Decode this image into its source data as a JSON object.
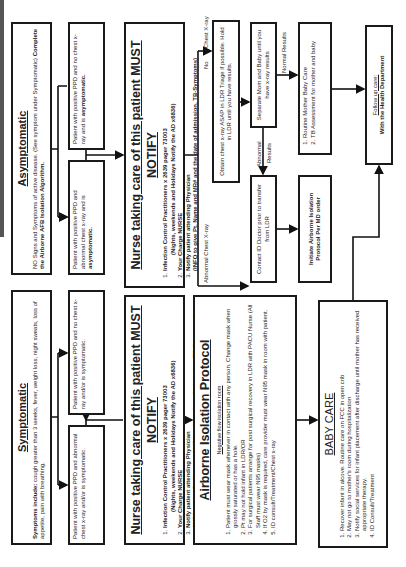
{
  "asymptomatic": {
    "title": "Asymptomatic",
    "body_plain": "NO Signs and Symptoms of active disease. (See symptom under Symptomatic)   ",
    "body_bold": "Complete the Airborne AFB Isolation Algorithm."
  },
  "symptomatic": {
    "title": "Symptomatic",
    "body_bold": "Symptoms include:",
    "body_plain": " cough greater than 3 weeks, fever, weight loss, night sweats, loss of appetite, pain with breathing."
  },
  "asym_no_cxr": {
    "text": "Patient with positive PPD and no chest x-ray and is ",
    "bold": "asymptomatic."
  },
  "asym_abnormal": {
    "text": "Patient with positive PPD and abnormal chest x-ray and is ",
    "bold": "asymptomatic."
  },
  "sym_no_cxr": {
    "text": "Patient with positive PPD and no chest x-ray and/or is ",
    "bold": "symptomatic."
  },
  "sym_abnormal": {
    "text": "Patient with positive PPD and abnormal chest x-ray and/or is ",
    "bold": "symptomatic."
  },
  "nurse": {
    "title": "Nurse taking care of this patient MUST NOTIFY",
    "items": [
      "Infection Control Practitioners x 2639 pager 73003",
      "Your Charge NURSE",
      "Notify patient attending Physician"
    ],
    "item1_note": "(Nights, weekends and Holidays Notify the AD x6836)",
    "item3_note": "(INFO to give Pt. Name and MR# and the date of admission, TB-Symptoms)"
  },
  "obtain_cxr": {
    "text": "Obtain chest x-ray ASAP in LDR Triage if possible.  Hold in LDR until you have results."
  },
  "separate": {
    "text": "Separate Mom and Baby until you have x-ray results"
  },
  "contact_id": {
    "text": "Contact ID Doctor prior to transfer from LDR"
  },
  "routine": {
    "items": [
      "Routine Mother Baby Care",
      "TB Assessment for mother and baby"
    ]
  },
  "initiate": {
    "text": "Initiate Airborne Isolation Protocol Per MD order"
  },
  "follow_up": {
    "title": "Follow up care:",
    "text": "With the Health Department"
  },
  "airborne": {
    "title": "Airborne Isolation Protocol",
    "subtitle": "Negative flow isolation room",
    "items": [
      "Patient must wear mask whenever in contact with any person. Change mask when grossly saturated or has a hole.",
      "Pt may not hold infant in LDR/OR",
      "For surgical patients arrange for post surgical recovery in LDR with PACU Nurse (All Staff must wear N95 masks)",
      "If O2 by mask is required, care provider must wear N95 mask in room with patient.",
      "ID consult/Treatment/Chest x-ray"
    ]
  },
  "baby_care": {
    "title": "BABY CARE",
    "items": [
      "Recover infant in alcove.  Routine care on FCC in open crib",
      "May not go to mother's room during hospitalization",
      "Notify social services for infant placement after discharge until mother has received appropriate therapy.",
      "ID Consult/Treatment"
    ]
  },
  "labels": {
    "no": "No",
    "no_cxr": "Chest X-ray",
    "abnormal_cxr": "Abnormal Chest X-ray",
    "normal_results": "Normal Results",
    "abnormal": "Abnormal",
    "results": "Results"
  }
}
